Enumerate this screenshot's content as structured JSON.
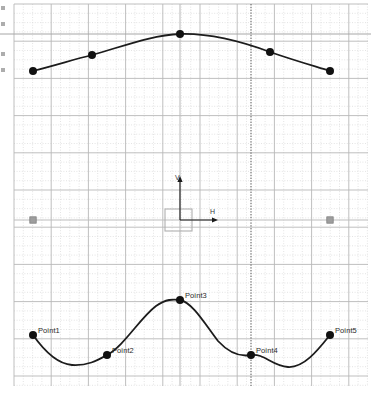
{
  "canvas": {
    "width": 371,
    "height": 398,
    "background": "#ffffff",
    "name": "spline-editor-canvas"
  },
  "grid": {
    "minor_spacing": 9.3,
    "major_spacing": 37.2,
    "minor_color": "#d9d9d9",
    "major_color": "#b8b8b8",
    "style": "dotted",
    "x_start": 14,
    "y_start": 4,
    "x_end": 368,
    "y_end": 386
  },
  "guides": {
    "horizontal_line": {
      "y": 34,
      "color": "#a6a6a6",
      "label": "horizontal-guide"
    },
    "vertical_line": {
      "x": 251,
      "color": "#555555",
      "label": "vertical-guide"
    },
    "center_vertical": {
      "x": 180,
      "color": "#bdbdbd"
    },
    "center_horizontal": {
      "y": 220,
      "color": "#bdbdbd"
    }
  },
  "axes": {
    "origin_x": 180,
    "origin_y": 220,
    "vertical_label": "V",
    "horizontal_label": "H",
    "vertical_arrow_top": 176,
    "horizontal_arrow_right": 218,
    "handle_box": {
      "x": 165,
      "y": 209,
      "w": 27,
      "h": 22,
      "color": "#b0b0b0"
    },
    "color": "#1a1a1a"
  },
  "handles": [
    {
      "name": "left-handle",
      "x": 33,
      "y": 220
    },
    {
      "name": "right-handle",
      "x": 330,
      "y": 220
    }
  ],
  "chart_data": {
    "type": "line",
    "title": "",
    "xlabel": "",
    "ylabel": "",
    "grid": true,
    "legend": false,
    "series": [
      {
        "name": "upper-curve",
        "labelled": false,
        "stroke": "#1c1c1c",
        "stroke_width": 1.8,
        "points": [
          {
            "label": "",
            "x": 33,
            "y": 71
          },
          {
            "label": "",
            "x": 92,
            "y": 55
          },
          {
            "label": "",
            "x": 180,
            "y": 34
          },
          {
            "label": "",
            "x": 270,
            "y": 52
          },
          {
            "label": "",
            "x": 330,
            "y": 71
          }
        ],
        "path": "M33,71 C60,64 72,60 92,55 C124,46 152,35 180,34 C212,33 243,42 270,52 C293,60 314,66 330,71"
      },
      {
        "name": "lower-curve",
        "labelled": true,
        "stroke": "#1c1c1c",
        "stroke_width": 1.8,
        "points": [
          {
            "label": "Point1",
            "x": 33,
            "y": 335
          },
          {
            "label": "Point2",
            "x": 107,
            "y": 355
          },
          {
            "label": "Point3",
            "x": 180,
            "y": 300
          },
          {
            "label": "Point4",
            "x": 251,
            "y": 355
          },
          {
            "label": "Point5",
            "x": 330,
            "y": 335
          }
        ],
        "path": "M33,335 C45,352 58,364 72,365 C88,366 98,360 107,355 C124,346 140,318 156,306 C166,299 173,299 180,300 C192,302 205,324 218,341 C229,353 240,357 251,355 C264,353 272,366 288,367 C304,368 318,350 330,335"
      }
    ]
  },
  "point_marker": {
    "radius": 4,
    "fill": "#111111"
  },
  "edge_marks": {
    "name": "clipped-toolbar-marks",
    "positions": [
      6,
      22,
      52,
      68
    ]
  }
}
